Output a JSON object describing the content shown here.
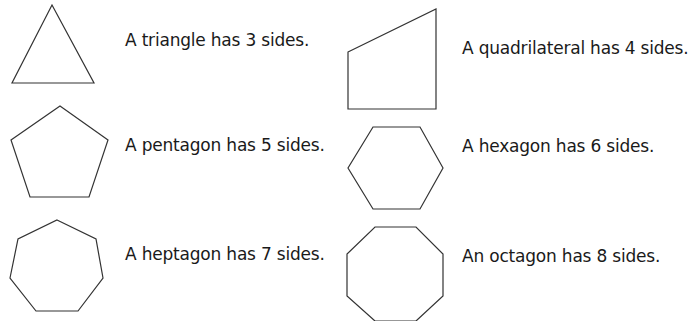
{
  "shapes": [
    {
      "name": "triangle",
      "sides": 3,
      "label": "A triangle has 3 sides.",
      "points": "52,5 94,83 12,83"
    },
    {
      "name": "quadrilateral",
      "sides": 4,
      "label": "A quadrilateral has 4 sides.",
      "points": "348,52 436,9 436,109 348,109"
    },
    {
      "name": "pentagon",
      "sides": 5,
      "label": "A pentagon has 5 sides.",
      "points": "60,106 108,140 89,197 30,197 11,140"
    },
    {
      "name": "hexagon",
      "sides": 6,
      "label": "A hexagon has 6 sides.",
      "points": "373,127 420,127 443,168 420,209 373,209 348,168"
    },
    {
      "name": "heptagon",
      "sides": 7,
      "label": "A heptagon has 7 sides.",
      "points": "57,220 96,239 103,278 78,311 36,311 10,278 18,239"
    },
    {
      "name": "octagon",
      "sides": 8,
      "label": "An octagon has 8 sides.",
      "points": "375,227 416,227 443,254 443,296 416,321 375,321 347,296 347,254"
    }
  ],
  "stroke_color": "#333333"
}
